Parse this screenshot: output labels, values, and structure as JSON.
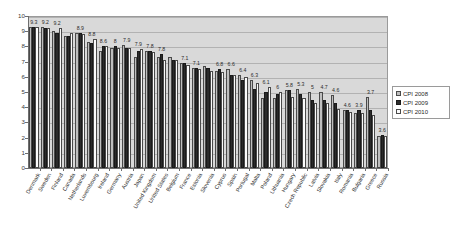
{
  "chart_data": {
    "type": "bar",
    "title": "",
    "subtitle": "",
    "xlabel": "",
    "ylabel": "",
    "ylim": [
      0,
      10
    ],
    "ytick_values": [
      0,
      1,
      2,
      3,
      4,
      5,
      6,
      7,
      8,
      9,
      10
    ],
    "ytick_labels": [
      "0",
      "1",
      "2",
      "3",
      "4",
      "5",
      "6",
      "7",
      "8",
      "9",
      "10"
    ],
    "grid": true,
    "legend_position": "right",
    "legend_entries": [
      "CPI 2008",
      "CPI 2009",
      "CPI 2010"
    ],
    "series_colors": [
      "#bfbfbf",
      "#2b2b2b",
      "#fbfbfb"
    ],
    "categories": [
      "Denmark",
      "Sweden",
      "Finland",
      "Canada",
      "Netherlands",
      "Luxembourg",
      "Ireland",
      "Germany",
      "Austria",
      "Japan",
      "United Kingdom",
      "United States",
      "Belgium",
      "France",
      "Estonia",
      "Slovenia",
      "Cyprus",
      "Spain",
      "Portugal",
      "Malta",
      "Poland",
      "Lithuania",
      "Hungary",
      "Czech Republic",
      "Latvia",
      "Slovakia",
      "Italy",
      "Romania",
      "Bulgaria",
      "Greece",
      "Russia"
    ],
    "series": [
      {
        "name": "CPI 2008",
        "values": [
          9.3,
          9.3,
          9.0,
          8.7,
          8.9,
          8.3,
          7.7,
          7.9,
          8.1,
          7.3,
          7.7,
          7.3,
          7.3,
          6.9,
          6.6,
          6.7,
          6.4,
          6.5,
          6.1,
          5.8,
          4.6,
          4.6,
          5.1,
          5.2,
          5.0,
          5.0,
          4.8,
          3.8,
          3.6,
          4.7,
          2.1
        ]
      },
      {
        "name": "CPI 2009",
        "values": [
          9.3,
          9.2,
          8.9,
          8.7,
          8.9,
          8.2,
          8.0,
          8.0,
          7.9,
          7.7,
          7.7,
          7.5,
          7.1,
          6.9,
          6.6,
          6.6,
          6.5,
          6.1,
          5.8,
          5.2,
          5.0,
          4.9,
          5.1,
          4.9,
          4.5,
          4.5,
          4.3,
          3.8,
          3.8,
          3.8,
          2.2
        ]
      },
      {
        "name": "CPI 2010",
        "values": [
          9.3,
          9.2,
          9.2,
          8.9,
          8.8,
          8.5,
          8.0,
          7.9,
          7.9,
          7.8,
          7.6,
          7.1,
          7.1,
          6.8,
          6.5,
          6.4,
          6.3,
          6.1,
          6.0,
          5.6,
          5.3,
          5.0,
          4.7,
          4.6,
          4.3,
          4.3,
          3.9,
          3.7,
          3.6,
          3.5,
          2.1
        ]
      }
    ],
    "data_labels": [
      {
        "category": "Denmark",
        "text": "9.3"
      },
      {
        "category": "Sweden",
        "text": "9.2"
      },
      {
        "category": "Finland",
        "text": "9.2"
      },
      {
        "category": "Netherlands",
        "text": "8.9"
      },
      {
        "category": "Luxembourg",
        "text": "8.8"
      },
      {
        "category": "Ireland",
        "text": "8.6"
      },
      {
        "category": "Germany",
        "text": "8"
      },
      {
        "category": "Austria",
        "text": "7.9"
      },
      {
        "category": "Japan",
        "text": "7.9"
      },
      {
        "category": "United Kingdom",
        "text": "7.8"
      },
      {
        "category": "United States",
        "text": "7.8"
      },
      {
        "category": "France",
        "text": "7.1"
      },
      {
        "category": "Estonia",
        "text": "7.1"
      },
      {
        "category": "Cyprus",
        "text": "6.8"
      },
      {
        "category": "Spain",
        "text": "6.6"
      },
      {
        "category": "Portugal",
        "text": "6.4"
      },
      {
        "category": "Malta",
        "text": "6.3"
      },
      {
        "category": "Poland",
        "text": "6.1"
      },
      {
        "category": "Lithuania",
        "text": "6"
      },
      {
        "category": "Hungary",
        "text": "5.8"
      },
      {
        "category": "Czech Republic",
        "text": "5.3"
      },
      {
        "category": "Latvia",
        "text": "5"
      },
      {
        "category": "Slovakia",
        "text": "4.7"
      },
      {
        "category": "Italy",
        "text": "4.6"
      },
      {
        "category": "Romania",
        "text": "4.6"
      },
      {
        "category": "Bulgaria",
        "text": "3.9"
      },
      {
        "category": "Greece",
        "text": "3.7"
      },
      {
        "category": "Russia",
        "text": "3.6"
      },
      {
        "category": "Russia2",
        "text": "3.5"
      },
      {
        "category": "RussiaLast",
        "text": "2.1"
      }
    ]
  }
}
